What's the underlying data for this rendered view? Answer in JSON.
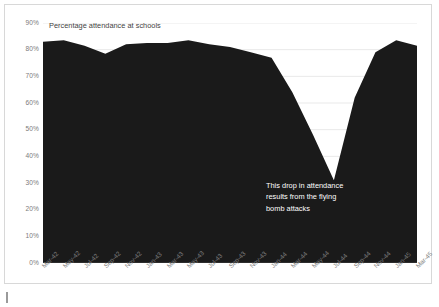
{
  "chart_data": {
    "type": "area",
    "title": "Percentage attendance at schools",
    "xlabel": "",
    "ylabel": "",
    "ylim": [
      0,
      90
    ],
    "grid": true,
    "legend_position": "none",
    "series_color": "#1a1a1a",
    "categories": [
      "Mar-42",
      "May-42",
      "Jul-42",
      "Sep-42",
      "Nov-42",
      "Jan-43",
      "Mar-43",
      "May-43",
      "Jul-43",
      "Sep-43",
      "Nov-43",
      "Jan-44",
      "Mar-44",
      "May-44",
      "Jul-44",
      "Sep-44",
      "Nov-44",
      "Jan-45",
      "Mar-45"
    ],
    "values": [
      83.0,
      83.5,
      81.5,
      78.5,
      82.0,
      82.5,
      82.5,
      83.5,
      82.0,
      81.0,
      79.0,
      77.0,
      64.0,
      48.0,
      31.0,
      62.0,
      79.0,
      83.5,
      81.5
    ],
    "ytick_labels": [
      "90%",
      "80%",
      "70%",
      "60%",
      "50%",
      "40%",
      "30%",
      "20%",
      "10%",
      "0%"
    ],
    "ytick_values": [
      90,
      80,
      70,
      60,
      50,
      40,
      30,
      20,
      10,
      0
    ],
    "annotations": [
      {
        "lines": [
          "This drop in attendance",
          "results from the flying",
          "bomb attacks"
        ],
        "color": "#ffffff"
      }
    ]
  },
  "caption": {
    "text": ""
  }
}
